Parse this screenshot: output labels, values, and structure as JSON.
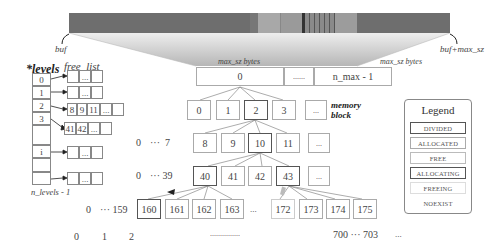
{
  "buffer": {
    "start_label": "buf",
    "end_label": "buf+max_sz",
    "segments": [
      {
        "x": 69,
        "w": 181,
        "color": "#6e6e6e"
      },
      {
        "x": 250,
        "w": 8,
        "color": "#777777"
      },
      {
        "x": 258,
        "w": 22,
        "color": "#a8a8a8"
      },
      {
        "x": 280,
        "w": 22,
        "color": "#9a9a9a"
      },
      {
        "x": 302,
        "w": 3,
        "color": "#333333"
      },
      {
        "x": 305,
        "w": 30,
        "color": "#8a8a8a"
      },
      {
        "x": 335,
        "w": 22,
        "color": "#9c9c9c"
      },
      {
        "x": 357,
        "w": 93,
        "color": "#6e6e6e"
      }
    ]
  },
  "levels_array": {
    "title": "*levels",
    "entries": [
      "0",
      "1",
      "2",
      "3",
      "",
      "i",
      "",
      ""
    ],
    "last_label": "n_levels - 1"
  },
  "free_list": {
    "title": "free_list",
    "rows": [
      {
        "level": "0",
        "items": [
          "",
          "...",
          ""
        ]
      },
      {
        "level": "1",
        "items": [
          "",
          "...",
          ""
        ]
      },
      {
        "level": "2",
        "items": [
          "8",
          "9",
          "11",
          "...",
          ""
        ]
      },
      {
        "level": "3",
        "items": [
          "41",
          "42",
          "...",
          ""
        ]
      },
      {
        "level": "i",
        "items": [
          "",
          "...",
          ""
        ]
      },
      {
        "level": "n_levels - 1",
        "items": [
          "",
          "...",
          ""
        ]
      }
    ]
  },
  "top_blocks": {
    "size_label_1": "max_sz bytes",
    "size_label_2": "max_sz bytes",
    "first": "0",
    "dots": "......",
    "last": "n_max - 1"
  },
  "tree": {
    "level1": {
      "prefix": "",
      "blocks": [
        "0",
        "1",
        "2",
        "3",
        "..."
      ]
    },
    "memory_block_label": "memory block",
    "level2": {
      "prefix_start": "0",
      "prefix_dots": "···",
      "prefix_end": "7",
      "blocks": [
        "8",
        "9",
        "10",
        "11",
        "..."
      ]
    },
    "level3": {
      "prefix_start": "0",
      "prefix_dots": "···",
      "prefix_end": "39",
      "blocks": [
        "40",
        "41",
        "42",
        "43",
        "..."
      ]
    },
    "level4": {
      "prefix_start": "0",
      "prefix_dots": "···",
      "prefix_end": "159",
      "blocks": [
        "160",
        "161",
        "162",
        "163",
        "...",
        "172",
        "173",
        "174",
        "175"
      ]
    },
    "level5": {
      "items": [
        "0",
        "1",
        "2"
      ],
      "middle_dots": "...............",
      "range_start": "700",
      "range_dots": "···",
      "range_end": "703",
      "tail": "..."
    }
  },
  "legend": {
    "title": "Legend",
    "items": [
      {
        "label": "DIVIDED",
        "border": "#555555"
      },
      {
        "label": "ALLOCATED",
        "border": "#aaaaaa"
      },
      {
        "label": "FREE",
        "border": "#bbbbbb"
      },
      {
        "label": "ALLOCATING",
        "border": "#555555"
      },
      {
        "label": "FREEING",
        "border": "#cccccc"
      },
      {
        "label": "NOEXIST",
        "border": "none"
      }
    ]
  }
}
